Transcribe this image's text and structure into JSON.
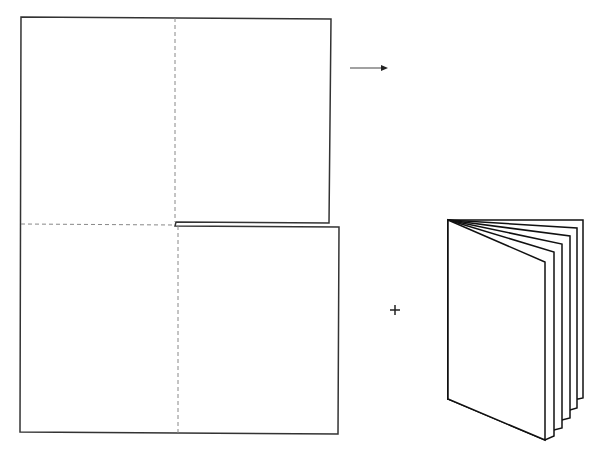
{
  "diagram": {
    "title": "",
    "colors": {
      "outline": "#333333",
      "fold_line": "#888888",
      "booklet_stroke": "#111111",
      "background": "#ffffff"
    },
    "elements": {
      "flat_sheet": {
        "label": "",
        "upper_panel": {
          "x1": 21,
          "y1": 17,
          "x2": 331,
          "y2": 223
        },
        "lower_panel": {
          "x1": 20,
          "y1": 226,
          "x2": 339,
          "y2": 434
        },
        "slit": {
          "start_x": 174,
          "end_x": 331,
          "y_top": 222,
          "y_bottom": 226
        },
        "fold_lines": [
          {
            "orientation": "vertical",
            "panel": "upper",
            "x": 175
          },
          {
            "orientation": "vertical",
            "panel": "lower",
            "x": 178
          },
          {
            "orientation": "horizontal",
            "panel": "left",
            "y": 224
          }
        ]
      },
      "arrow": {
        "symbol": "right-arrow",
        "x1": 350,
        "x2": 387,
        "y": 68
      },
      "plus_sign": {
        "symbol": "+",
        "x": 395,
        "y": 310
      },
      "booklet": {
        "label": "",
        "page_count": 6,
        "spine_top": {
          "x": 448,
          "y": 220
        },
        "spine_bottom": {
          "x": 448,
          "y": 399
        }
      }
    }
  }
}
